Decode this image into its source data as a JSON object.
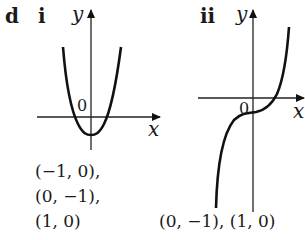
{
  "figure": {
    "part_label": "d",
    "graphs": [
      {
        "label": "i",
        "axis_x_label": "x",
        "axis_y_label": "y",
        "origin_label": "0",
        "curve_type": "parabola (even-degree, U-shape)",
        "answer_lines": [
          "(−1, 0),",
          "(0, −1),",
          "(1, 0)"
        ]
      },
      {
        "label": "ii",
        "axis_x_label": "x",
        "axis_y_label": "y",
        "origin_label": "0",
        "curve_type": "cubic (odd-degree, increasing)",
        "answer_lines": [
          "(0, −1), (1, 0)"
        ]
      }
    ],
    "colors": {
      "ink": "#111111",
      "background": "#ffffff"
    }
  }
}
